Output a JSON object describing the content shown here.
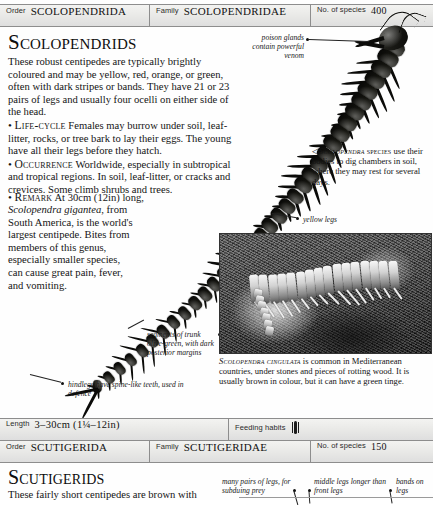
{
  "header_bar": {
    "order_key": "Order",
    "order_value": "SCOLOPENDRIDA",
    "family_key": "Family",
    "family_value": "SCOLOPENDRIDAE",
    "species_key": "No. of species",
    "species_value": "400"
  },
  "length_bar": {
    "length_key": "Length",
    "length_value": "3–30cm (1¼–12in)",
    "feeding_key": "Feeding habits"
  },
  "footer_bar": {
    "order_key": "Order",
    "order_value": "SCUTIGERIDA",
    "family_key": "Family",
    "family_value": "SCUTIGERIDAE",
    "species_key": "No. of species",
    "species_value": "150"
  },
  "main": {
    "title": "Scolopendrids",
    "paragraph_1": "These robust centipedes are typically brightly coloured and may be yellow, red, orange, or green, often with dark stripes or bands. They have 21 or 23 pairs of legs and usually four ocelli on either side of the head.",
    "life_cycle_label": "Life-cycle",
    "life_cycle_text": "Females may burrow under soil, leaf-litter, rocks, or tree bark to lay their eggs. The young have all their legs before they hatch.",
    "occurrence_label": "Occurrence",
    "occurrence_text": "Worldwide, especially in subtropical and tropical regions. In soil, leaf-litter, or cracks and crevices. Some climb shrubs and trees.",
    "remark_label": "Remark",
    "remark_text_1": "At 30cm (12in) long,",
    "remark_species": "Scolopendra gigantea",
    "remark_text_2": ", from South America, is the world's largest centipede. Bites from members of this genus, especially smaller species, can cause great pain, fever, and vomiting.",
    "bullet": "•"
  },
  "annotations": {
    "poison_glands": "poison glands contain powerful venom",
    "yellow_legs": "yellow legs",
    "trunk_segments": "segments of trunk olive-green, with dark posterior margins",
    "hindlegs": "hindlegs have spine-like teeth, used in defence"
  },
  "captions": {
    "species_marker": "◁",
    "species_name": "Scolopendra",
    "species_word": "species",
    "species_rest": " use their bodies to dig chambers in soil, where they may rest for several days.",
    "photo_name": "Scolopendra cingulata",
    "photo_rest": " is common in Mediterranean countries, under stones and pieces of rotting wood. It is usually brown in colour, but it can have a green tinge."
  },
  "footer_section": {
    "title": "Scutigerids",
    "paragraph": "These fairly short centipedes are brown with",
    "anno_many_legs": "many pairs of legs, for subduing prey",
    "anno_middle_legs": "middle legs longer than front legs",
    "anno_bands": "bands on legs"
  },
  "colors": {
    "rule": "#8d8d8d",
    "bar_fill": "#e8e8e6",
    "ink": "#141414",
    "art": "#0d0d0b"
  }
}
